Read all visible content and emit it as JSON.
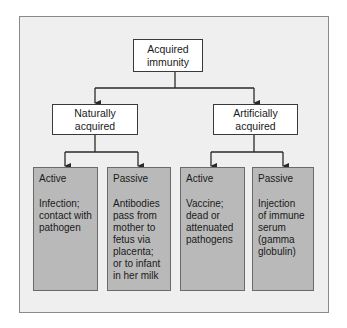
{
  "diagram": {
    "root": {
      "label": "Acquired\nimmunity"
    },
    "branches": [
      {
        "label": "Naturally\nacquired",
        "children": [
          {
            "title": "Active",
            "description": "Infection;\ncontact with\npathogen"
          },
          {
            "title": "Passive",
            "description": "Antibodies\npass from\nmother to\nfetus via\nplacenta;\nor to infant\nin her milk"
          }
        ]
      },
      {
        "label": "Artificially\nacquired",
        "children": [
          {
            "title": "Active",
            "description": "Vaccine;\ndead or\nattenuated\npathogens"
          },
          {
            "title": "Passive",
            "description": "Injection\nof immune\nserum\n(gamma\nglobulin)"
          }
        ]
      }
    ],
    "colors": {
      "frame_background": "#efefef",
      "node_background": "#ffffff",
      "leaf_background": "#b9b9b9",
      "line": "#2a2a2a"
    }
  }
}
